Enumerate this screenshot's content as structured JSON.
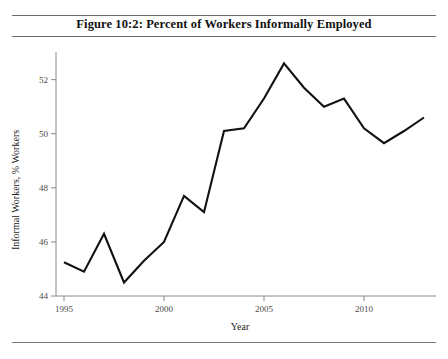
{
  "document": {
    "running_head": "",
    "figure_title": "Figure 10:2: Percent of Workers Informally Employed"
  },
  "chart_data": {
    "type": "line",
    "title": "Figure 10:2: Percent of Workers Informally Employed",
    "xlabel": "Year",
    "ylabel": "Informal Workers, % Workers",
    "x": [
      1995,
      1996,
      1997,
      1998,
      1999,
      2000,
      2001,
      2002,
      2003,
      2004,
      2005,
      2006,
      2007,
      2008,
      2009,
      2010,
      2011,
      2012,
      2013
    ],
    "values": [
      45.25,
      44.9,
      46.3,
      44.5,
      45.3,
      46.0,
      47.7,
      47.1,
      50.1,
      50.2,
      51.3,
      52.6,
      51.7,
      51.0,
      51.3,
      50.2,
      49.65,
      50.1,
      50.6
    ],
    "series": [
      {
        "name": "Informal Workers",
        "values": [
          45.25,
          44.9,
          46.3,
          44.5,
          45.3,
          46.0,
          47.7,
          47.1,
          50.1,
          50.2,
          51.3,
          52.6,
          51.7,
          51.0,
          51.3,
          50.2,
          49.65,
          50.1,
          50.6
        ],
        "color": "#111111"
      }
    ],
    "xlim": [
      1994.6,
      2013.4
    ],
    "ylim": [
      44.0,
      52.8
    ],
    "xticks": [
      1995,
      2000,
      2005,
      2010
    ],
    "xticklabels": [
      "1995",
      "2000",
      "2005",
      "2010"
    ],
    "yticks": [
      44,
      46,
      48,
      50,
      52
    ],
    "yticklabels": [
      "44",
      "46",
      "48",
      "50",
      "52"
    ],
    "grid": false,
    "legend": "none"
  }
}
